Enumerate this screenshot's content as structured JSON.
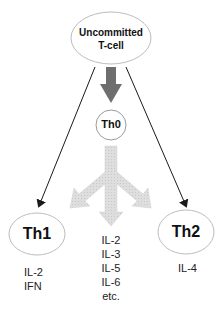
{
  "nodes": {
    "uncommitted": {
      "line1": "Uncommitted",
      "line2": "T-cell"
    },
    "th0": {
      "label": "Th0"
    },
    "th1": {
      "label": "Th1"
    },
    "th2": {
      "label": "Th2"
    }
  },
  "cytokines": {
    "th1": [
      "IL-2",
      "IFN"
    ],
    "th0": [
      "IL-2",
      "IL-3",
      "IL-5",
      "IL-6",
      "etc."
    ],
    "th2": [
      "IL-4"
    ]
  },
  "colors": {
    "ellipse_stroke": "#bdbdbd",
    "thick_arrow": "#6e6e6e",
    "branch_arrow": "#dcdcdc",
    "thin_arrow": "#1a1a1a"
  }
}
